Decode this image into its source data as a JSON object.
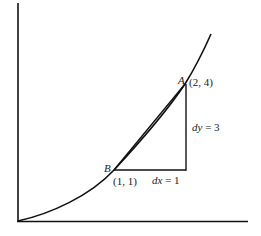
{
  "diagram": {
    "type": "secant-vs-tangent on parabola y = x^2",
    "axes": {
      "x_axis": true,
      "y_axis": true,
      "origin_label": ""
    },
    "curve": {
      "function": "y = x^2"
    },
    "points": [
      {
        "id": "A",
        "label": "A",
        "coords": "(2, 4)"
      },
      {
        "id": "B",
        "label": "B",
        "coords": "(1, 1)"
      }
    ],
    "increments": {
      "dx_label": "dx = 1",
      "dy_label": "dy = 3"
    },
    "colors": {
      "stroke": "#111111",
      "background": "#ffffff"
    }
  }
}
